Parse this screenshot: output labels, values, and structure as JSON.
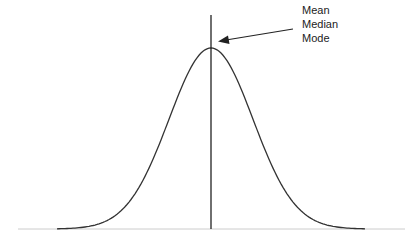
{
  "diagram": {
    "type": "normal-distribution",
    "labels": [
      "Mean",
      "Median",
      "Mode"
    ],
    "colors": {
      "curve": "#333333",
      "center_line": "#222222",
      "baseline": "#cccccc",
      "arrow": "#222222",
      "text": "#222222",
      "background": "#ffffff"
    }
  },
  "chart_data": {
    "type": "line",
    "title": "",
    "xlabel": "",
    "ylabel": "",
    "annotations": [
      {
        "text": "Mean",
        "points_to": "peak"
      },
      {
        "text": "Median",
        "points_to": "peak"
      },
      {
        "text": "Mode",
        "points_to": "peak"
      }
    ],
    "grid": false,
    "legend": null,
    "center": 0,
    "x_range": [
      -3.7,
      3.7
    ]
  }
}
